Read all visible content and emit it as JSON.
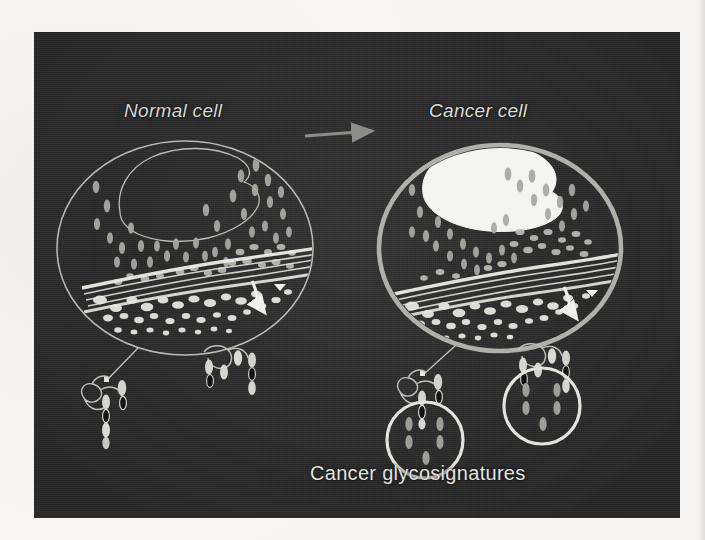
{
  "figure": {
    "panel_bg": "#2b2b2b",
    "page_bg": "#f6f5f3",
    "stroke_light": "#d9d9d4",
    "stroke_dim": "#9d9d97",
    "fill_white": "#f2f2ee",
    "fill_grey": "#a8a8a2",
    "fill_dark": "#1a1a1a"
  },
  "labels": {
    "normal_cell": "Normal cell",
    "cancer_cell": "Cancer cell",
    "glycosignatures": "Cancer glycosignatures"
  },
  "icons": {
    "transition_arrow": "arrow-right-icon",
    "secretion_arrow_normal": "curved-secretion-arrow-icon",
    "secretion_arrow_cancer": "curved-secretion-arrow-icon",
    "leader_line_normal": "leader-line-icon",
    "leader_line_cancer": "leader-line-icon"
  },
  "diagram": {
    "type": "biological-schematic",
    "panels": [
      {
        "name": "normal-cell",
        "title": "Normal cell",
        "membrane": {
          "cx": 185,
          "cy": 248,
          "rx": 128,
          "ry": 107,
          "stroke_width": 1.4,
          "stroke": "#c8c8c3"
        },
        "nucleus": {
          "filled": false,
          "outline": "#b9b9b4",
          "note": "irregular outline, unfilled"
        },
        "organelles": "stippled vesicles and wavy golgi bands",
        "glycoconjugates": 2,
        "highlight_circles": 0
      },
      {
        "name": "cancer-cell",
        "title": "Cancer cell",
        "membrane": {
          "cx": 500,
          "cy": 248,
          "rx": 121,
          "ry": 103,
          "stroke_width": 4.5,
          "stroke": "#bdbdb8"
        },
        "nucleus": {
          "filled": true,
          "fill": "#f4f4f0",
          "note": "irregular solid white mass, enlarged"
        },
        "organelles": "stippled vesicles and wavy golgi bands",
        "glycoconjugates": 2,
        "highlight_circles": 2
      }
    ],
    "transition": {
      "from": "normal-cell",
      "to": "cancer-cell",
      "marker": "arrow"
    },
    "callout": {
      "label": "Cancer glycosignatures",
      "targets": 2
    }
  }
}
